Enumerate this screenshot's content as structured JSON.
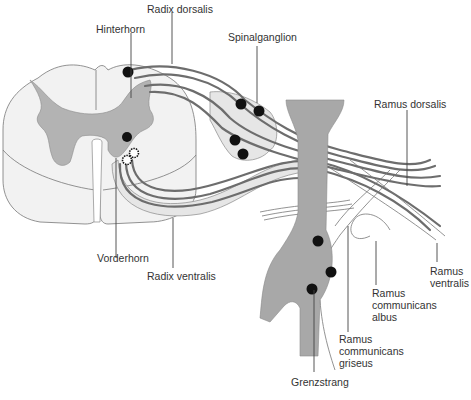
{
  "diagram": {
    "colors": {
      "white_matter": "#f2f2f2",
      "grey_matter": "#b3b3b3",
      "trunk": "#a8a8a8",
      "fibers": "#6d6d6d",
      "neuron_bodies": "#111111",
      "label_text": "#333333"
    },
    "labels": {
      "radix_dorsalis": "Radix dorsalis",
      "hinterhorn": "Hinterhorn",
      "spinalganglion": "Spinalganglion",
      "ramus_dorsalis": "Ramus dorsalis",
      "vorderhorn": "Vorderhorn",
      "radix_ventralis": "Radix ventralis",
      "ramus_ventralis": [
        "Ramus",
        "ventralis"
      ],
      "ramus_communicans_albus": [
        "Ramus",
        "communicans",
        "albus"
      ],
      "ramus_communicans_griseus": [
        "Ramus",
        "communicans",
        "griseus"
      ],
      "grenzstrang": "Grenzstrang"
    }
  }
}
